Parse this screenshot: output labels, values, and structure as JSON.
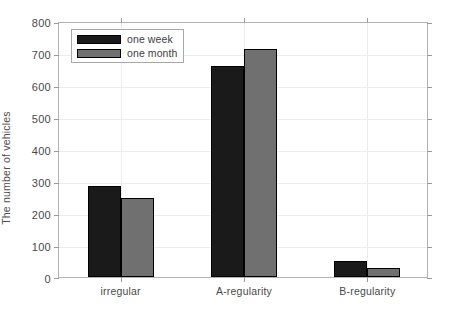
{
  "chart_data": {
    "type": "bar",
    "title": "",
    "xlabel": "",
    "ylabel": "The number of vehicles",
    "categories": [
      "irregular",
      "A-regularity",
      "B-regularity"
    ],
    "series": [
      {
        "name": "one week",
        "color": "#1a1a1a",
        "values": [
          283,
          660,
          50
        ]
      },
      {
        "name": "one month",
        "color": "#707070",
        "values": [
          246,
          713,
          28
        ]
      }
    ],
    "ylim": [
      0,
      800
    ],
    "yticks": [
      0,
      100,
      200,
      300,
      400,
      500,
      600,
      700,
      800
    ],
    "ytick_labels": [
      "0",
      "100",
      "200",
      "300",
      "400",
      "500",
      "600",
      "700",
      "800"
    ],
    "grid": true,
    "grid_axis": "both",
    "legend_position": "top-left",
    "legend_entries": [
      "one week",
      "one month"
    ],
    "bar_edge_color": "#000000",
    "axes_color": "#b3b3b3",
    "grid_color": "#ececec",
    "background": "#ffffff"
  }
}
